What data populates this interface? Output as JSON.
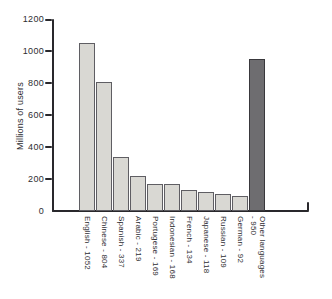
{
  "chart_data": {
    "type": "bar",
    "title": "",
    "ylabel": "Millions of users",
    "xlabel": "",
    "ylim": [
      0,
      1200
    ],
    "yticks": [
      0,
      200,
      400,
      600,
      800,
      1000,
      1200
    ],
    "grid": false,
    "legend": false,
    "categories": [
      "English",
      "Chinese",
      "Spanish",
      "Arabic",
      "Portugese",
      "Indonesian",
      "French",
      "Japanese",
      "Russian",
      "German",
      "Other languages"
    ],
    "values": [
      1052,
      804,
      337,
      219,
      169,
      168,
      134,
      118,
      109,
      92,
      950
    ],
    "bar_labels": [
      "English - 1052",
      "Chinese - 804",
      "Spanish - 337",
      "Arabic - 219",
      "Portugese - 169",
      "Indonesian - 168",
      "French - 134",
      "Japanese - 118",
      "Russian - 109",
      "German - 92",
      "Other languages\n- 950"
    ],
    "highlight_index": 10,
    "colors": {
      "bar_fill": "#d9d8d3",
      "bar_border": "#5f5e63",
      "highlight_fill": "#6e6d70",
      "highlight_border": "#39383c",
      "axis": "#29282c",
      "text": "#2e2d31",
      "background": "#ffffff"
    }
  }
}
